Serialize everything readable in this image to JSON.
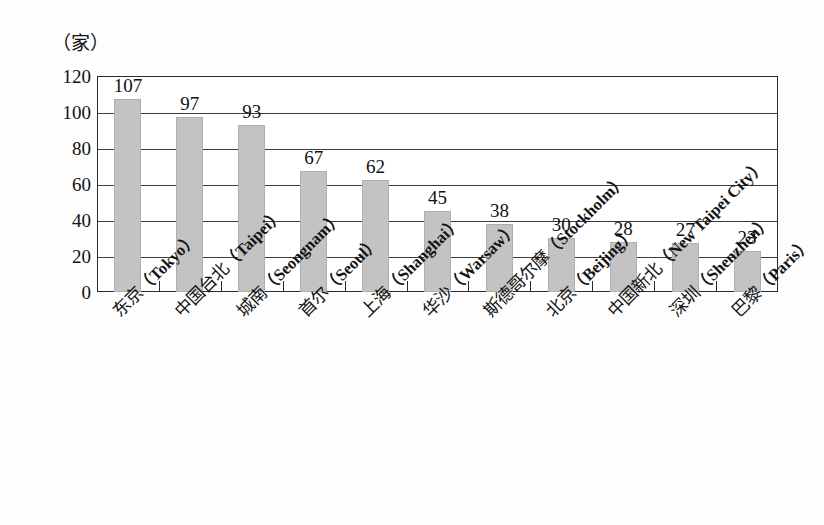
{
  "unit_label": "（家）",
  "colors": {
    "bar_fill": "#c3c3c3",
    "bar_stroke": "#aeaeae",
    "axis": "#2b2b2b",
    "grid": "#3a3a3a",
    "text": "#111111",
    "background": "#fdfdfd"
  },
  "chart_data": {
    "type": "bar",
    "title": "",
    "subtitle": "",
    "xlabel": "",
    "ylabel": "（家）",
    "ylim": [
      0,
      120
    ],
    "ytick_values": [
      0,
      20,
      40,
      60,
      80,
      100,
      120
    ],
    "ytick_labels": [
      "0",
      "20",
      "40",
      "60",
      "80",
      "100",
      "120"
    ],
    "grid": true,
    "grid_orientation": "horizontal",
    "legend": false,
    "legend_position": "none",
    "label_rotation_degrees": -45,
    "categories": [
      "东京（Tokyo）",
      "中国台北（Taipei）",
      "城南（Seongnam）",
      "首尔（Seoul）",
      "上海（Shanghai）",
      "华沙（Warsaw）",
      "斯德哥尔摩（Stockholm）",
      "北京（Beijing）",
      "中国新北（New Taipei City）",
      "深圳（Shenzhen）",
      "巴黎（Paris）"
    ],
    "categories_cn": [
      "东京",
      "中国台北",
      "城南",
      "首尔",
      "上海",
      "华沙",
      "斯德哥尔摩",
      "北京",
      "中国新北",
      "深圳",
      "巴黎"
    ],
    "categories_en": [
      "Tokyo",
      "Taipei",
      "Seongnam",
      "Seoul",
      "Shanghai",
      "Warsaw",
      "Stockholm",
      "Beijing",
      "New Taipei City",
      "Shenzhen",
      "Paris"
    ],
    "values": [
      107,
      97,
      93,
      67,
      62,
      45,
      38,
      30,
      28,
      27,
      23
    ],
    "value_labels": [
      "107",
      "97",
      "93",
      "67",
      "62",
      "45",
      "38",
      "30",
      "28",
      "27",
      "23"
    ]
  }
}
